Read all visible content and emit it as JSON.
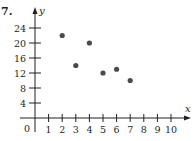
{
  "problem_number": "7.",
  "chart_data": {
    "type": "scatter",
    "title": "",
    "xlabel": "x",
    "ylabel": "y",
    "origin_label": "0",
    "x_ticks": [
      "1",
      "2",
      "3",
      "4",
      "5",
      "6",
      "7",
      "8",
      "9",
      "10"
    ],
    "y_ticks": [
      "4",
      "8",
      "12",
      "16",
      "20",
      "24"
    ],
    "xlim": [
      0,
      10.5
    ],
    "ylim": [
      0,
      26
    ],
    "grid": false,
    "legend": null,
    "points": [
      {
        "x": 2,
        "y": 22
      },
      {
        "x": 3,
        "y": 14
      },
      {
        "x": 4,
        "y": 20
      },
      {
        "x": 5,
        "y": 12
      },
      {
        "x": 6,
        "y": 13
      },
      {
        "x": 7,
        "y": 10
      }
    ],
    "point_color": "#4a4a4a",
    "axis_color": "#231f20"
  }
}
